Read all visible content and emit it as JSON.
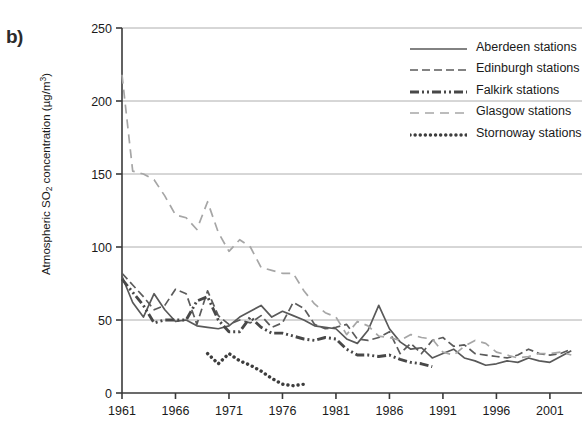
{
  "panel": {
    "label": "b)"
  },
  "axes": {
    "ylabel_main": "Atmospheric SO",
    "ylabel_sub": "2",
    "ylabel_tail": " concentration (µg/m",
    "ylabel_sup": "3",
    "ylabel_close": ")"
  },
  "legend": {
    "items": [
      {
        "label": "Aberdeen stations",
        "style": "solid",
        "color": "#595959"
      },
      {
        "label": "Edinburgh stations",
        "style": "dashed",
        "color": "#5b5b5b"
      },
      {
        "label": "Falkirk stations",
        "style": "dashdotdot",
        "color": "#484848"
      },
      {
        "label": "Glasgow stations",
        "style": "longdash",
        "color": "#a6a6a6"
      },
      {
        "label": "Stornoway stations",
        "style": "dotted",
        "color": "#3d3d3d"
      }
    ]
  },
  "chart_data": {
    "type": "line",
    "title": "",
    "xlabel": "",
    "ylabel": "Atmospheric SO2 concentration (µg/m3)",
    "xlim": [
      1961,
      2004
    ],
    "ylim": [
      0,
      250
    ],
    "yticks": [
      0,
      50,
      100,
      150,
      200,
      250
    ],
    "xticks": [
      1961,
      1966,
      1971,
      1976,
      1981,
      1986,
      1991,
      1996,
      2001
    ],
    "grid": true,
    "legend_position": "top-right",
    "series": [
      {
        "name": "Aberdeen stations",
        "style": "solid",
        "color": "#595959",
        "x": [
          1961,
          1962,
          1963,
          1964,
          1965,
          1966,
          1967,
          1968,
          1969,
          1970,
          1971,
          1972,
          1973,
          1974,
          1975,
          1976,
          1977,
          1978,
          1979,
          1980,
          1981,
          1982,
          1983,
          1984,
          1985,
          1986,
          1987,
          1988,
          1989,
          1990,
          1991,
          1992,
          1993,
          1994,
          1995,
          1996,
          1997,
          1998,
          1999,
          2000,
          2001,
          2002,
          2003
        ],
        "y": [
          80,
          62,
          52,
          68,
          57,
          49,
          50,
          46,
          45,
          44,
          46,
          52,
          56,
          60,
          52,
          56,
          53,
          50,
          46,
          45,
          44,
          37,
          34,
          43,
          60,
          44,
          35,
          30,
          31,
          24,
          27,
          30,
          24,
          22,
          19,
          20,
          22,
          21,
          24,
          22,
          21,
          25,
          29
        ]
      },
      {
        "name": "Edinburgh stations",
        "style": "dashed",
        "color": "#5b5b5b",
        "x": [
          1961,
          1962,
          1963,
          1964,
          1965,
          1966,
          1967,
          1968,
          1969,
          1970,
          1971,
          1972,
          1973,
          1974,
          1975,
          1976,
          1977,
          1978,
          1979,
          1980,
          1981,
          1982,
          1983,
          1984,
          1985,
          1986,
          1987,
          1988,
          1989,
          1990,
          1991,
          1992,
          1993,
          1994,
          1995,
          1996,
          1997,
          1998,
          1999,
          2000,
          2001,
          2002,
          2003
        ],
        "y": [
          82,
          74,
          66,
          57,
          60,
          71,
          68,
          47,
          70,
          53,
          47,
          50,
          48,
          53,
          45,
          48,
          62,
          58,
          47,
          44,
          45,
          47,
          37,
          36,
          38,
          42,
          27,
          34,
          27,
          36,
          38,
          32,
          33,
          27,
          26,
          25,
          24,
          26,
          30,
          27,
          26,
          27,
          30
        ]
      },
      {
        "name": "Falkirk stations",
        "style": "dashdotdot",
        "color": "#484848",
        "x": [
          1961,
          1962,
          1963,
          1964,
          1965,
          1966,
          1967,
          1968,
          1969,
          1970,
          1971,
          1972,
          1973,
          1974,
          1975,
          1976,
          1977,
          1978,
          1979,
          1980,
          1981,
          1982,
          1983,
          1984,
          1985,
          1986,
          1987,
          1988,
          1989,
          1990
        ],
        "y": [
          78,
          69,
          60,
          48,
          50,
          50,
          50,
          63,
          66,
          50,
          42,
          42,
          52,
          45,
          41,
          41,
          39,
          37,
          36,
          38,
          37,
          30,
          26,
          26,
          25,
          26,
          23,
          21,
          20,
          18
        ]
      },
      {
        "name": "Glasgow stations",
        "style": "longdash",
        "color": "#a6a6a6",
        "x": [
          1961,
          1962,
          1963,
          1964,
          1965,
          1966,
          1967,
          1968,
          1969,
          1970,
          1971,
          1972,
          1973,
          1974,
          1975,
          1976,
          1977,
          1978,
          1979,
          1980,
          1981,
          1982,
          1983,
          1984,
          1985,
          1986,
          1987,
          1988,
          1989,
          1990,
          1991,
          1992,
          1993,
          1994,
          1995,
          1996,
          1997,
          1998,
          1999,
          2000,
          2001,
          2002,
          2003
        ],
        "y": [
          218,
          152,
          150,
          146,
          135,
          122,
          120,
          112,
          131,
          110,
          97,
          105,
          100,
          86,
          84,
          82,
          82,
          70,
          61,
          55,
          52,
          40,
          49,
          46,
          39,
          38,
          36,
          40,
          38,
          37,
          28,
          26,
          32,
          36,
          34,
          28,
          26,
          24,
          25,
          27,
          27,
          28,
          26
        ]
      },
      {
        "name": "Stornoway stations",
        "style": "dotted",
        "color": "#3d3d3d",
        "x": [
          1969,
          1970,
          1971,
          1972,
          1973,
          1974,
          1975,
          1976,
          1977,
          1978
        ],
        "y": [
          27,
          20,
          27,
          22,
          19,
          15,
          10,
          6,
          5,
          6
        ]
      }
    ]
  }
}
